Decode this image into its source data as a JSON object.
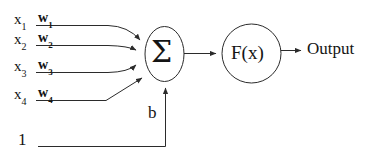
{
  "diagram": {
    "type": "neural-network-neuron",
    "stroke_color": "#2b2b2b",
    "text_color": "#141414",
    "background_color": "#ffffff",
    "inputs": [
      {
        "input_label": "x",
        "input_sub": "1",
        "weight_label": "w",
        "weight_sub": "1"
      },
      {
        "input_label": "x",
        "input_sub": "2",
        "weight_label": "w",
        "weight_sub": "2"
      },
      {
        "input_label": "x",
        "input_sub": "3",
        "weight_label": "w",
        "weight_sub": "3"
      },
      {
        "input_label": "x",
        "input_sub": "4",
        "weight_label": "w",
        "weight_sub": "4"
      }
    ],
    "bias": {
      "constant_label": "1",
      "weight_label": "b"
    },
    "summation": {
      "label": "Σ",
      "shape": "ellipse"
    },
    "activation": {
      "label": "F(x)",
      "shape": "circle"
    },
    "output": {
      "label": "Output"
    }
  }
}
